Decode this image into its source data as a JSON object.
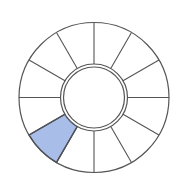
{
  "diagram": {
    "type": "segmented-ring",
    "segment_count": 12,
    "center": [
      94,
      97.5
    ],
    "outer_radius": 75,
    "inner_ring_outer_radius": 33.5,
    "inner_ring_inner_radius": 30.5,
    "stroke_color": "#555555",
    "background_color": "#ffffff",
    "highlighted_segments": [
      {
        "index": 7,
        "start_angle_deg": 210,
        "end_angle_deg": 240,
        "fill": "#a8bde8",
        "stroke": "#3a3f55"
      }
    ]
  }
}
